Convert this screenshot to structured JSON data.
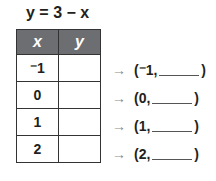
{
  "equation": "y = 3 − x",
  "table": {
    "headers": [
      "x",
      "y"
    ],
    "rows": [
      {
        "x": "⁻1",
        "y": ""
      },
      {
        "x": "0",
        "y": ""
      },
      {
        "x": "1",
        "y": ""
      },
      {
        "x": "2",
        "y": ""
      }
    ]
  },
  "pairs": [
    {
      "arrow": "→",
      "open": "(⁻1,",
      "close": ")"
    },
    {
      "arrow": "→",
      "open": "(0,",
      "close": ")"
    },
    {
      "arrow": "→",
      "open": "(1,",
      "close": ")"
    },
    {
      "arrow": "→",
      "open": "(2,",
      "close": ")"
    }
  ]
}
